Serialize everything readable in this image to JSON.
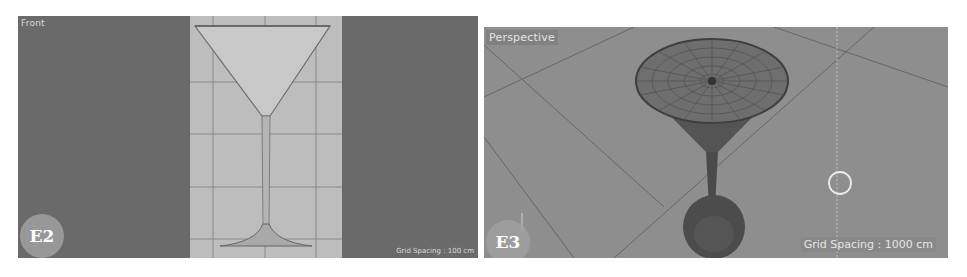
{
  "panels": [
    {
      "id": "E2",
      "viewport_label": "Front",
      "badge": "E2",
      "grid_spacing": "Grid Spacing : 100 cm",
      "content": "martini-glass-reference-image"
    },
    {
      "id": "E3",
      "viewport_label": "Perspective",
      "badge": "E3",
      "grid_spacing": "Grid Spacing : 1000 cm",
      "content": "martini-glass-3d-model-wireframe"
    }
  ],
  "colors": {
    "viewport_dark": "#6a6a6a",
    "viewport_perspective": "#8e8e8e",
    "reference_bg": "#bdbdbd",
    "model_shade": "#4e4e4e"
  }
}
